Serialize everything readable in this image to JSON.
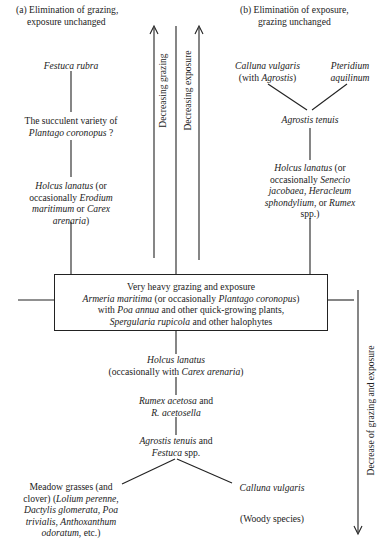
{
  "headings": {
    "a": "(a) Elimination of grazing,\nexposure unchanged",
    "a_line1": "(a) Elimination of grazing,",
    "a_line2": "exposure unchanged",
    "b_line1": "(b) Eliminatiön of exposure,",
    "b_line2": "grazing unchanged"
  },
  "arrows": {
    "decreasing_grazing": "Decreasing grazing",
    "decreasing_exposure": "Decreasing exposure",
    "decrease_both": "Decrease of grazing and exposure"
  },
  "branch_a": {
    "festuca": "Festuca rubra",
    "plantago_l1_pre": "The succulent variety of",
    "plantago_l2_italic": "Plantago coronopus",
    "plantago_l2_post": " ?",
    "holcus_l1_italic": "Holcus lanatus",
    "holcus_l1_post": " (or",
    "holcus_l2_pre": "occasionally ",
    "holcus_l2_italic": "Erodium",
    "holcus_l3_italic_a": "maritimum",
    "holcus_l3_mid": " or ",
    "holcus_l3_italic_b": "Carex",
    "holcus_l4_italic": "arenaria",
    "holcus_l4_post": ")"
  },
  "branch_b": {
    "calluna_italic": "Calluna vulgaris",
    "calluna_l2_pre": "(with ",
    "calluna_l2_italic": "Agrostis",
    "calluna_l2_post": ")",
    "pteridium_l1": "Pteridium",
    "pteridium_l2": "aquilinum",
    "agrostis": "Agrostis tenuis",
    "holcus_l1_italic": "Holcus lanatus",
    "holcus_l1_post": " (or",
    "holcus_l2_pre": "occasionally ",
    "holcus_l2_italic": "Senecio",
    "holcus_l3_italic_a": "jacobaea",
    "holcus_l3_mid": ", ",
    "holcus_l3_italic_b": "Heracleum",
    "holcus_l4_italic": "sphondylium",
    "holcus_l4_mid": ", or ",
    "holcus_l4_italic_b": "Rumex",
    "holcus_l5": "spp.)"
  },
  "center_box": {
    "line1": "Very heavy grazing and exposure",
    "line2_italic_a": "Armeria maritima",
    "line2_mid": " (or occasionally ",
    "line2_italic_b": "Plantago coronopus",
    "line2_post": ")",
    "line3_pre": "with ",
    "line3_italic": "Poa annua",
    "line3_post": " and other quick-growing plants,",
    "line4_italic": "Spergularia rupicola",
    "line4_post": " and other halophytes"
  },
  "lower": {
    "holcus_italic": "Holcus lanatus",
    "holcus_l2_pre": "(occasionally with ",
    "holcus_l2_italic": "Carex arenaria",
    "holcus_l2_post": ")",
    "rumex_l1_italic": "Rumex acetosa",
    "rumex_l1_post": " and",
    "rumex_l2_italic": "R. acetosella",
    "agrostis_l1_italic": "Agrostis tenuis",
    "agrostis_l1_post": " and",
    "agrostis_l2_italic": "Festuca",
    "agrostis_l2_post": " spp.",
    "meadow_l1": "Meadow grasses (and",
    "meadow_l2_pre": "clover) (",
    "meadow_l2_italic": "Lolium perenne",
    "meadow_l2_post": ",",
    "meadow_l3_italic_a": "Dactylis glomerata",
    "meadow_l3_mid": ", ",
    "meadow_l3_italic_b": "Poa",
    "meadow_l4_italic_a": "trivialis",
    "meadow_l4_mid": ", ",
    "meadow_l4_italic_b": "Anthoxanthum",
    "meadow_l5_italic": "odoratum",
    "meadow_l5_post": ", etc.)",
    "calluna_italic": "Calluna vulgaris",
    "woody": "(Woody species)"
  }
}
